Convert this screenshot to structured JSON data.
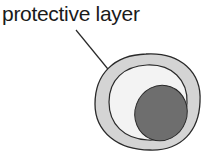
{
  "diagram": {
    "label": "protective layer",
    "colors": {
      "outline": "#2a2a2a",
      "layer_fill": "#d4d4d4",
      "inner_fill": "#f3f3f3",
      "nucleus_fill": "#6e6e6e"
    }
  }
}
